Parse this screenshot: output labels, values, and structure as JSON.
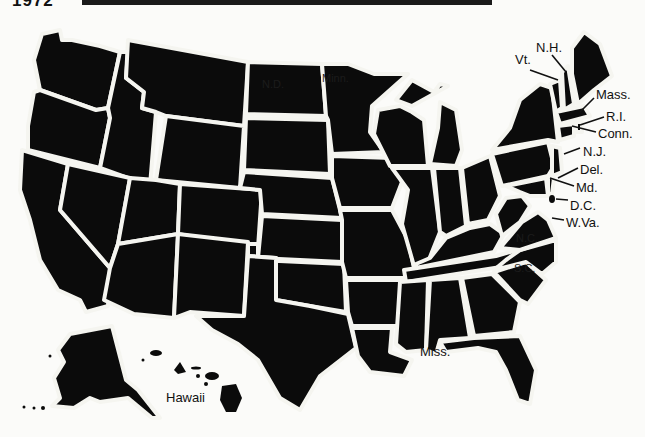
{
  "header": {
    "year": "1972"
  },
  "map": {
    "title": "United States",
    "colors": {
      "land": "#0b0b0b",
      "border": "#f5f5f0",
      "background": "#fbfbf9",
      "text": "#111111"
    },
    "labels": {
      "nh": "N.H.",
      "vt": "Vt.",
      "mass": "Mass.",
      "ri": "R.I.",
      "conn": "Conn.",
      "nj": "N.J.",
      "del": "Del.",
      "md": "Md.",
      "dc": "D.C.",
      "wva": "W.Va.",
      "miss": "Miss.",
      "hawaii": "Hawaii",
      "nd": "N.D.",
      "minn": "Minn.",
      "nc": "N.C.",
      "sc": "S.C."
    }
  }
}
